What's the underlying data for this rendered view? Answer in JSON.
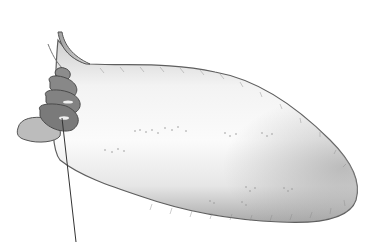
{
  "figure": {
    "background": "#ffffff",
    "colors": {
      "body_fill_light": "#f4f4f4",
      "body_fill_mid": "#dcdcdc",
      "body_outline": "#6a6a6a",
      "shell_fill": "#8a8a8a",
      "shell_dark": "#5c5c5c",
      "foot_fill": "#b8b8b8",
      "pointer_line": "#333333"
    },
    "parts": [
      {
        "name": "body",
        "label": ""
      },
      {
        "name": "shell",
        "label": ""
      },
      {
        "name": "foot-lobe",
        "label": ""
      },
      {
        "name": "siphon-tip",
        "label": ""
      }
    ],
    "pointer": {
      "from": [
        62,
        118
      ],
      "to": [
        76,
        242
      ],
      "label": ""
    }
  }
}
